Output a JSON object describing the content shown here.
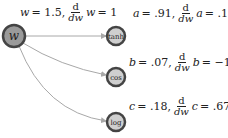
{
  "diagram": {
    "nodes": [
      {
        "id": "w",
        "label": "w",
        "x": 14,
        "y": 36,
        "r": 11,
        "fill": "#9a9a9a",
        "border": "#444444"
      },
      {
        "id": "tanh",
        "label": "tanh",
        "x": 116,
        "y": 36,
        "r": 9,
        "fill": "#cfcfcf",
        "border": "#444444"
      },
      {
        "id": "cos",
        "label": "cos",
        "x": 116,
        "y": 77,
        "r": 9,
        "fill": "#cfcfcf",
        "border": "#444444"
      },
      {
        "id": "log",
        "label": "log",
        "x": 116,
        "y": 122,
        "r": 9,
        "fill": "#cfcfcf",
        "border": "#444444"
      }
    ],
    "edges": [
      {
        "from": "w",
        "to": "tanh"
      },
      {
        "from": "w",
        "to": "cos"
      },
      {
        "from": "w",
        "to": "log"
      }
    ],
    "annotations": {
      "w": {
        "var": "w",
        "value": "= 1.5,",
        "dnum": "d",
        "dden": "dw",
        "dvar": "w",
        "dval": "= 1"
      },
      "a": {
        "var": "a",
        "value": "= .91,",
        "dnum": "d",
        "dden": "dw",
        "dvar": "a",
        "dval": "= .18"
      },
      "b": {
        "var": "b",
        "value": "= .07,",
        "dnum": "d",
        "dden": "dw",
        "dvar": "b",
        "dval": "= −1.0"
      },
      "c": {
        "var": "c",
        "value": "= .18,",
        "dnum": "d",
        "dden": "dw",
        "dvar": "c",
        "dval": "= .67"
      }
    },
    "colors": {
      "edge": "#a8a8a8",
      "text": "#222222"
    }
  }
}
